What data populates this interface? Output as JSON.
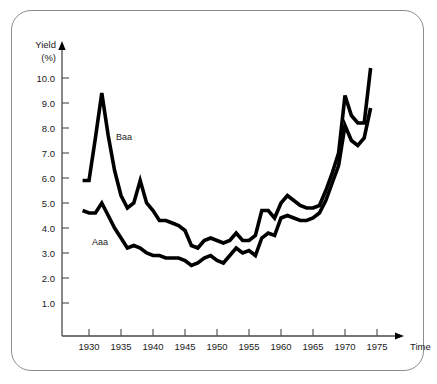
{
  "figure": {
    "frame_color": "#8d8d8d",
    "background": "#ffffff",
    "line_color": "#000000"
  },
  "axes": {
    "y_title_line1": "Yield",
    "y_title_line2": "(%)",
    "x_title": "Time"
  },
  "chart_data": {
    "type": "line",
    "title": "",
    "subtitle": "",
    "xlabel": "Time",
    "ylabel": "Yield (%)",
    "xlim": [
      1928,
      1977
    ],
    "ylim": [
      0,
      10.8
    ],
    "grid": false,
    "legend": "inline-labels",
    "y_ticks": [
      "1.0",
      "2.0",
      "3.0",
      "4.0",
      "5.0",
      "6.0",
      "7.0",
      "8.0",
      "9.0",
      "10.0"
    ],
    "y_tick_values": [
      1.0,
      2.0,
      3.0,
      4.0,
      5.0,
      6.0,
      7.0,
      8.0,
      9.0,
      10.0
    ],
    "x_ticks": [
      "1930",
      "1935",
      "1940",
      "1945",
      "1950",
      "1955",
      "1960",
      "1965",
      "1970",
      "1975"
    ],
    "x_tick_values": [
      1930,
      1935,
      1940,
      1945,
      1950,
      1955,
      1960,
      1965,
      1970,
      1975
    ],
    "x": [
      1929,
      1930,
      1931,
      1932,
      1933,
      1934,
      1935,
      1936,
      1937,
      1938,
      1939,
      1940,
      1941,
      1942,
      1943,
      1944,
      1945,
      1946,
      1947,
      1948,
      1949,
      1950,
      1951,
      1952,
      1953,
      1954,
      1955,
      1956,
      1957,
      1958,
      1959,
      1960,
      1961,
      1962,
      1963,
      1964,
      1965,
      1966,
      1967,
      1968,
      1969,
      1970,
      1971,
      1972,
      1973,
      1974
    ],
    "series": [
      {
        "name": "Baa",
        "label": "Baa",
        "color": "#000000",
        "values": [
          5.9,
          5.9,
          7.6,
          9.4,
          7.7,
          6.3,
          5.3,
          4.8,
          5.0,
          5.9,
          5.0,
          4.7,
          4.3,
          4.3,
          4.2,
          4.1,
          3.9,
          3.3,
          3.2,
          3.5,
          3.6,
          3.5,
          3.4,
          3.5,
          3.8,
          3.5,
          3.5,
          3.7,
          4.7,
          4.7,
          4.4,
          5.0,
          5.3,
          5.1,
          4.9,
          4.8,
          4.8,
          4.9,
          5.5,
          6.2,
          7.0,
          9.3,
          8.5,
          8.2,
          8.2,
          10.4
        ]
      },
      {
        "name": "Aaa",
        "label": "Aaa",
        "color": "#000000",
        "values": [
          4.7,
          4.6,
          4.6,
          5.0,
          4.5,
          4.0,
          3.6,
          3.2,
          3.3,
          3.2,
          3.0,
          2.9,
          2.9,
          2.8,
          2.8,
          2.8,
          2.7,
          2.5,
          2.6,
          2.8,
          2.9,
          2.7,
          2.6,
          2.9,
          3.2,
          3.0,
          3.1,
          2.9,
          3.6,
          3.8,
          3.7,
          4.4,
          4.5,
          4.4,
          4.3,
          4.3,
          4.4,
          4.6,
          5.1,
          5.8,
          6.5,
          8.1,
          7.5,
          7.3,
          7.6,
          8.8
        ]
      }
    ]
  },
  "annotations": [
    {
      "text": "Baa",
      "series": "Baa"
    },
    {
      "text": "Aaa",
      "series": "Aaa"
    }
  ]
}
